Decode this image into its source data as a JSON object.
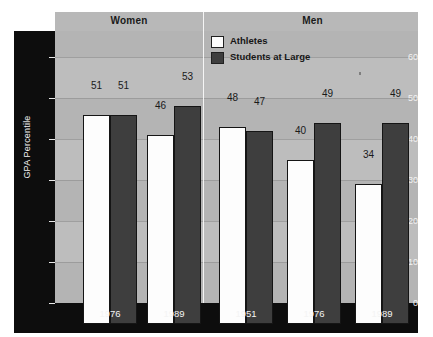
{
  "top_caption": "",
  "legend": {
    "items": [
      {
        "label": "Athletes",
        "swatch": "#fdfdfd",
        "key": "athletes"
      },
      {
        "label": "Students at Large",
        "swatch": "#3e3e3e",
        "key": "students"
      }
    ]
  },
  "panels": [
    {
      "title": "Women"
    },
    {
      "title": "Men"
    }
  ],
  "axis": {
    "y_title": "GPA Percentile",
    "y_ticks": [
      "0",
      "10",
      "20",
      "30",
      "40",
      "50",
      "60"
    ]
  },
  "chart_data": {
    "type": "bar",
    "title": "",
    "xlabel": "",
    "ylabel": "GPA Percentile",
    "ylim": [
      0,
      65
    ],
    "ytick_values": [
      0,
      10,
      20,
      30,
      40,
      50,
      60
    ],
    "grid": true,
    "legend_position": "top-center-right",
    "panels": [
      {
        "name": "Women",
        "categories": [
          "1976",
          "1989"
        ],
        "series": [
          {
            "name": "Athletes",
            "values": [
              51,
              46
            ],
            "color": "#fdfdfd"
          },
          {
            "name": "Students at Large",
            "values": [
              51,
              53
            ],
            "color": "#3e3e3e"
          }
        ]
      },
      {
        "name": "Men",
        "categories": [
          "1951",
          "1976",
          "1989"
        ],
        "series": [
          {
            "name": "Athletes",
            "values": [
              48,
              40,
              34
            ],
            "color": "#fdfdfd"
          },
          {
            "name": "Students at Large",
            "values": [
              47,
              49,
              49
            ],
            "color": "#3e3e3e"
          }
        ]
      }
    ]
  },
  "colors": {
    "plot_background": "#b4b4b4",
    "axis_band": "#0d0d0d",
    "athletes_bar": "#fdfdfd",
    "students_bar": "#3e3e3e",
    "gridline": "#8f8f8f"
  }
}
